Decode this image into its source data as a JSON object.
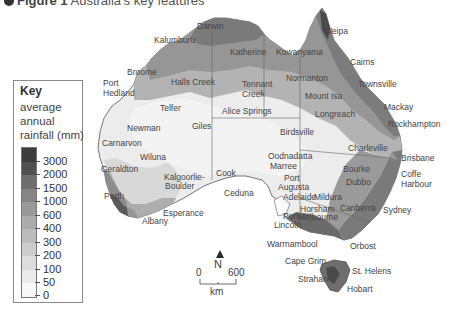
{
  "title": {
    "figure": "Figure 1",
    "text": "Australia's key features"
  },
  "key": {
    "title": "Key",
    "subtitle": "average annual rainfall (mm)",
    "bands": [
      {
        "label": "3000",
        "color": "#3d3d3d"
      },
      {
        "label": "2000",
        "color": "#4f4f4f"
      },
      {
        "label": "1500",
        "color": "#6e6e6e"
      },
      {
        "label": "1000",
        "color": "#858585"
      },
      {
        "label": "600",
        "color": "#999999"
      },
      {
        "label": "400",
        "color": "#ababab"
      },
      {
        "label": "300",
        "color": "#bcbcbc"
      },
      {
        "label": "200",
        "color": "#cdcdcd"
      },
      {
        "label": "100",
        "color": "#dddddd"
      },
      {
        "label": "50",
        "color": "#ebebeb"
      },
      {
        "label": "0",
        "color": "#f8f8f8"
      }
    ]
  },
  "north_arrow": {
    "label": "N"
  },
  "scale_bar": {
    "start": "0",
    "end": "600",
    "unit": "km"
  },
  "places": [
    {
      "name": "Darwin",
      "x": 197,
      "y": 22
    },
    {
      "name": "Kalumburu",
      "x": 154,
      "y": 36
    },
    {
      "name": "Katherine",
      "x": 230,
      "y": 48
    },
    {
      "name": "Kowanyama",
      "x": 276,
      "y": 48
    },
    {
      "name": "Weipa",
      "x": 324,
      "y": 27
    },
    {
      "name": "Cairns",
      "x": 350,
      "y": 58
    },
    {
      "name": "Normanton",
      "x": 286,
      "y": 74
    },
    {
      "name": "Townsville",
      "x": 358,
      "y": 80
    },
    {
      "name": "Broome",
      "x": 127,
      "y": 68
    },
    {
      "name": "Halls Creek",
      "x": 171,
      "y": 78
    },
    {
      "name": "Port",
      "x": 103,
      "y": 79
    },
    {
      "name": "Hedland",
      "x": 103,
      "y": 89
    },
    {
      "name": "Tennant",
      "x": 242,
      "y": 80
    },
    {
      "name": "Creek",
      "x": 242,
      "y": 90
    },
    {
      "name": "Mount Isa",
      "x": 305,
      "y": 92
    },
    {
      "name": "Mackay",
      "x": 384,
      "y": 103
    },
    {
      "name": "Longreach",
      "x": 315,
      "y": 110
    },
    {
      "name": "Rockhampton",
      "x": 388,
      "y": 120
    },
    {
      "name": "Telfer",
      "x": 160,
      "y": 104
    },
    {
      "name": "Alice Springs",
      "x": 222,
      "y": 107
    },
    {
      "name": "Newman",
      "x": 127,
      "y": 124
    },
    {
      "name": "Giles",
      "x": 192,
      "y": 122
    },
    {
      "name": "Birdsville",
      "x": 280,
      "y": 128
    },
    {
      "name": "Charleville",
      "x": 348,
      "y": 144
    },
    {
      "name": "Brisbane",
      "x": 401,
      "y": 154
    },
    {
      "name": "Carnarvon",
      "x": 102,
      "y": 139
    },
    {
      "name": "Wiluna",
      "x": 140,
      "y": 153
    },
    {
      "name": "Oodnadatta",
      "x": 268,
      "y": 152
    },
    {
      "name": "Marree",
      "x": 270,
      "y": 162
    },
    {
      "name": "Bourke",
      "x": 343,
      "y": 165
    },
    {
      "name": "Coffe",
      "x": 401,
      "y": 170
    },
    {
      "name": "Harbour",
      "x": 401,
      "y": 180
    },
    {
      "name": "Geraldton",
      "x": 101,
      "y": 165
    },
    {
      "name": "Kalgoorlie-",
      "x": 164,
      "y": 173
    },
    {
      "name": "Boulder",
      "x": 165,
      "y": 182
    },
    {
      "name": "Cook",
      "x": 216,
      "y": 169
    },
    {
      "name": "Port",
      "x": 284,
      "y": 174
    },
    {
      "name": "Augusta",
      "x": 278,
      "y": 183
    },
    {
      "name": "Dubbo",
      "x": 346,
      "y": 178
    },
    {
      "name": "Sydney",
      "x": 383,
      "y": 206
    },
    {
      "name": "Perth",
      "x": 104,
      "y": 192
    },
    {
      "name": "Ceduna",
      "x": 224,
      "y": 189
    },
    {
      "name": "Adelaide",
      "x": 283,
      "y": 193
    },
    {
      "name": "Mildura",
      "x": 314,
      "y": 193
    },
    {
      "name": "Canberra",
      "x": 340,
      "y": 204
    },
    {
      "name": "Esperance",
      "x": 163,
      "y": 209
    },
    {
      "name": "Horsham",
      "x": 300,
      "y": 205
    },
    {
      "name": "Melbourne",
      "x": 298,
      "y": 213
    },
    {
      "name": "Albany",
      "x": 142,
      "y": 217
    },
    {
      "name": "Port",
      "x": 283,
      "y": 212
    },
    {
      "name": "Lincoln",
      "x": 274,
      "y": 221
    },
    {
      "name": "Warrnambool",
      "x": 267,
      "y": 240
    },
    {
      "name": "Orbost",
      "x": 350,
      "y": 242
    },
    {
      "name": "Cape Grim",
      "x": 285,
      "y": 257
    },
    {
      "name": "St. Helens",
      "x": 352,
      "y": 267
    },
    {
      "name": "Strahan",
      "x": 298,
      "y": 275
    },
    {
      "name": "Hobart",
      "x": 347,
      "y": 285
    }
  ]
}
